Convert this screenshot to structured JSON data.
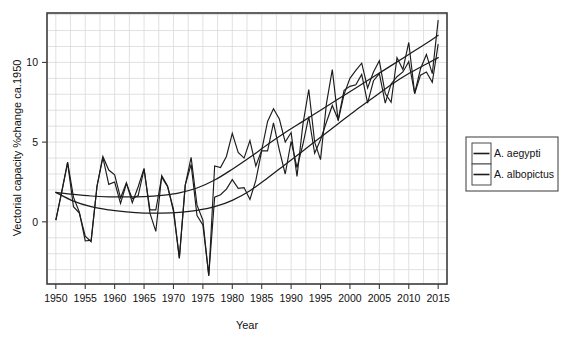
{
  "chart_data": {
    "type": "line",
    "title": "",
    "subtitle": "",
    "xlabel": "Year",
    "ylabel": "Vectorial capacity %change  ca.1950",
    "xlim": [
      1948.5,
      2016.5
    ],
    "ylim": [
      -3.9,
      13.1
    ],
    "xticks": [
      1950,
      1955,
      1960,
      1965,
      1970,
      1975,
      1980,
      1985,
      1990,
      1995,
      2000,
      2005,
      2010,
      2015
    ],
    "xticklabels": [
      "1950",
      "1955",
      "1960",
      "1965",
      "1970",
      "1975",
      "1980",
      "1985",
      "1990",
      "1995",
      "2000",
      "2005",
      "2010",
      "2015"
    ],
    "yticks": [
      0,
      5,
      10
    ],
    "yticklabels": [
      "0",
      "5",
      "10"
    ],
    "grid": true,
    "grid_color": "#d9d9dd",
    "legend_position": "right-outside",
    "legend": [
      "A. aegypti",
      "A. albopictus"
    ],
    "x": [
      1950,
      1951,
      1952,
      1953,
      1954,
      1955,
      1956,
      1957,
      1958,
      1959,
      1960,
      1961,
      1962,
      1963,
      1964,
      1965,
      1966,
      1967,
      1968,
      1969,
      1970,
      1971,
      1972,
      1973,
      1974,
      1975,
      1976,
      1977,
      1978,
      1979,
      1980,
      1981,
      1982,
      1983,
      1984,
      1985,
      1986,
      1987,
      1988,
      1989,
      1990,
      1991,
      1992,
      1993,
      1994,
      1995,
      1996,
      1997,
      1998,
      1999,
      2000,
      2001,
      2002,
      2003,
      2004,
      2005,
      2006,
      2007,
      2008,
      2009,
      2010,
      2011,
      2012,
      2013,
      2014,
      2015
    ],
    "series": [
      {
        "name": "A. aegypti",
        "color": "#1c1c1c",
        "values": [
          0.1,
          1.9,
          3.75,
          1.55,
          0.6,
          -1.2,
          -1.15,
          2.2,
          4.1,
          3.25,
          2.95,
          1.5,
          2.45,
          1.2,
          2.2,
          3.35,
          0.55,
          -0.6,
          2.9,
          2.25,
          0.65,
          -2.3,
          2.3,
          4.05,
          1.05,
          0.1,
          -3.4,
          3.5,
          3.4,
          4.1,
          5.55,
          4.35,
          4.0,
          5.1,
          3.5,
          4.5,
          6.3,
          7.1,
          6.45,
          5.0,
          5.6,
          2.85,
          6.1,
          8.3,
          5.0,
          3.9,
          7.4,
          9.55,
          6.35,
          8.0,
          9.0,
          9.5,
          9.95,
          8.4,
          9.4,
          10.1,
          8.05,
          7.5,
          10.3,
          9.55,
          11.25,
          8.05,
          9.6,
          10.5,
          9.3,
          12.65
        ],
        "linewidth": 1.15
      },
      {
        "name": "A. albopictus",
        "color": "#1c1c1c",
        "values": [
          0.1,
          1.85,
          3.7,
          0.95,
          0.55,
          -0.9,
          -1.25,
          2.25,
          4.05,
          2.35,
          2.5,
          1.15,
          2.4,
          1.45,
          1.65,
          3.3,
          0.75,
          0.75,
          2.8,
          2.2,
          0.8,
          -2.25,
          2.3,
          3.6,
          0.4,
          -0.2,
          -3.35,
          1.55,
          1.7,
          2.05,
          2.65,
          2.1,
          2.15,
          1.4,
          2.6,
          4.45,
          4.45,
          6.2,
          4.5,
          3.0,
          5.05,
          3.4,
          4.85,
          6.6,
          4.3,
          5.15,
          6.25,
          7.3,
          6.4,
          8.25,
          8.5,
          8.6,
          9.25,
          7.45,
          8.85,
          9.3,
          7.45,
          8.65,
          9.1,
          9.4,
          10.05,
          8.05,
          9.2,
          9.4,
          8.75,
          11.15
        ],
        "linewidth": 1.15
      }
    ],
    "trend_lines": [
      {
        "name": "A. aegypti trend",
        "color": "#1c1c1c",
        "x": [
          1950,
          1953,
          1956,
          1959,
          1962,
          1965,
          1968,
          1971,
          1974,
          1977,
          1980,
          1983,
          1986,
          1989,
          1992,
          1995,
          1998,
          2001,
          2004,
          2007,
          2010,
          2013,
          2015
        ],
        "y": [
          1.85,
          1.72,
          1.62,
          1.57,
          1.56,
          1.58,
          1.66,
          1.82,
          2.12,
          2.62,
          3.3,
          4.05,
          4.85,
          5.6,
          6.3,
          7.0,
          7.7,
          8.4,
          9.1,
          9.8,
          10.5,
          11.2,
          11.7
        ]
      },
      {
        "name": "A. albopictus trend",
        "color": "#1c1c1c",
        "x": [
          1950,
          1953,
          1956,
          1959,
          1962,
          1965,
          1968,
          1971,
          1974,
          1977,
          1980,
          1983,
          1986,
          1989,
          1992,
          1995,
          1998,
          2001,
          2004,
          2007,
          2010,
          2013,
          2015
        ],
        "y": [
          1.85,
          1.3,
          0.95,
          0.75,
          0.62,
          0.55,
          0.55,
          0.6,
          0.72,
          0.95,
          1.35,
          1.95,
          2.75,
          3.6,
          4.45,
          5.3,
          6.15,
          7.0,
          7.8,
          8.6,
          9.3,
          9.9,
          10.3
        ]
      }
    ]
  },
  "axes": {
    "xlabel": "Year",
    "ylabel": "Vectorial capacity %change  ca.1950"
  },
  "legend": {
    "items": [
      {
        "label": "A. aegypti"
      },
      {
        "label": "A. albopictus"
      }
    ]
  }
}
